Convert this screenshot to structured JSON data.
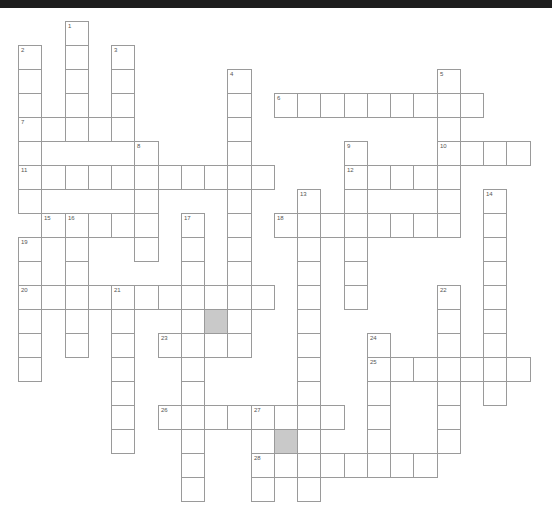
{
  "puzzle": {
    "grid": {
      "origin_x": 18,
      "origin_y": 21,
      "cell_w": 23.25,
      "cell_h": 24
    },
    "colors": {
      "border": "#9a9a9a",
      "blocked": "#c9c9c9",
      "number": "#555555",
      "topbar": "#1e1e1e"
    },
    "words": [
      {
        "number": "1",
        "direction": "down",
        "col": 2,
        "row": 0,
        "length": 5
      },
      {
        "number": "2",
        "direction": "down",
        "col": 0,
        "row": 1,
        "length": 7
      },
      {
        "number": "3",
        "direction": "down",
        "col": 4,
        "row": 1,
        "length": 4
      },
      {
        "number": "4",
        "direction": "down",
        "col": 9,
        "row": 2,
        "length": 12
      },
      {
        "number": "5",
        "direction": "down",
        "col": 18,
        "row": 2,
        "length": 6
      },
      {
        "number": "6",
        "direction": "across",
        "col": 11,
        "row": 3,
        "length": 9
      },
      {
        "number": "7",
        "direction": "across",
        "col": 0,
        "row": 4,
        "length": 5
      },
      {
        "number": "8",
        "direction": "down",
        "col": 5,
        "row": 5,
        "length": 5
      },
      {
        "number": "9",
        "direction": "down",
        "col": 14,
        "row": 5,
        "length": 7
      },
      {
        "number": "10",
        "direction": "across",
        "col": 18,
        "row": 5,
        "length": 4
      },
      {
        "number": "11",
        "direction": "across",
        "col": 0,
        "row": 6,
        "length": 11
      },
      {
        "number": "12",
        "direction": "across",
        "col": 14,
        "row": 6,
        "length": 5
      },
      {
        "number": "13",
        "direction": "down",
        "col": 12,
        "row": 7,
        "length": 13
      },
      {
        "number": "14",
        "direction": "down",
        "col": 20,
        "row": 7,
        "length": 9
      },
      {
        "number": "15",
        "direction": "across",
        "col": 1,
        "row": 8,
        "length": 5
      },
      {
        "number": "16",
        "direction": "down",
        "col": 2,
        "row": 8,
        "length": 6
      },
      {
        "number": "17",
        "direction": "down",
        "col": 7,
        "row": 8,
        "length": 12
      },
      {
        "number": "18",
        "direction": "across",
        "col": 11,
        "row": 8,
        "length": 8
      },
      {
        "number": "19",
        "direction": "down",
        "col": 0,
        "row": 9,
        "length": 6
      },
      {
        "number": "20",
        "direction": "across",
        "col": 0,
        "row": 11,
        "length": 11
      },
      {
        "number": "21",
        "direction": "down",
        "col": 4,
        "row": 11,
        "length": 7
      },
      {
        "number": "22",
        "direction": "down",
        "col": 18,
        "row": 11,
        "length": 7
      },
      {
        "number": "23",
        "direction": "across",
        "col": 6,
        "row": 13,
        "length": 4
      },
      {
        "number": "24",
        "direction": "down",
        "col": 15,
        "row": 13,
        "length": 6
      },
      {
        "number": "25",
        "direction": "across",
        "col": 15,
        "row": 14,
        "length": 7
      },
      {
        "number": "26",
        "direction": "across",
        "col": 6,
        "row": 16,
        "length": 8
      },
      {
        "number": "27",
        "direction": "down",
        "col": 10,
        "row": 16,
        "length": 4
      },
      {
        "number": "28",
        "direction": "across",
        "col": 10,
        "row": 18,
        "length": 8
      }
    ],
    "blocked_cells": [
      {
        "col": 8,
        "row": 12
      },
      {
        "col": 11,
        "row": 17
      }
    ]
  }
}
